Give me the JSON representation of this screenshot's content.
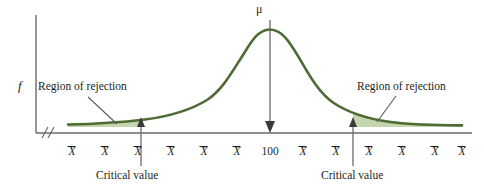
{
  "figure": {
    "title_text": "",
    "y_axis_label": "f",
    "center_label": "100",
    "mu_symbol": "μ",
    "region_of_rejection_left": "Region of rejection",
    "region_of_rejection_right": "Region of rejection",
    "critical_value_left": "Critical value",
    "critical_value_right": "Critical value",
    "xbar_symbol": "X",
    "colors": {
      "curve": "#4d6b33",
      "shaded_tail": "#c3d6ad",
      "axis": "#6b6b6b",
      "text": "#231f20",
      "arrow": "#6b6b6b",
      "background": "#ffffff"
    }
  },
  "chart_data": {
    "type": "line",
    "title": "",
    "xlabel": "",
    "ylabel": "f",
    "distribution": "normal",
    "mean_label": "100",
    "mean_symbol": "μ",
    "tick_labels": [
      "X̄",
      "X̄",
      "X̄",
      "X̄",
      "X̄",
      "X̄",
      "100",
      "X̄",
      "X̄",
      "X̄",
      "X̄",
      "X̄",
      "X̄"
    ],
    "tick_x_positions": [
      72,
      105,
      138,
      171,
      204,
      237,
      270,
      303,
      336,
      369,
      402,
      435,
      462
    ],
    "critical_values": [
      {
        "label": "Critical value",
        "x_position": 141,
        "side": "left"
      },
      {
        "label": "Critical value",
        "x_position": 353,
        "side": "right"
      }
    ],
    "rejection_regions": [
      {
        "label": "Region of rejection",
        "side": "left",
        "x_range": [
          68,
          141
        ]
      },
      {
        "label": "Region of rejection",
        "side": "right",
        "x_range": [
          353,
          462
        ]
      }
    ],
    "annotations": [
      "Region of rejection",
      "Region of rejection",
      "Critical value",
      "Critical value",
      "μ",
      "100",
      "f"
    ],
    "axis_break": true,
    "grid": false,
    "legend": "none"
  }
}
